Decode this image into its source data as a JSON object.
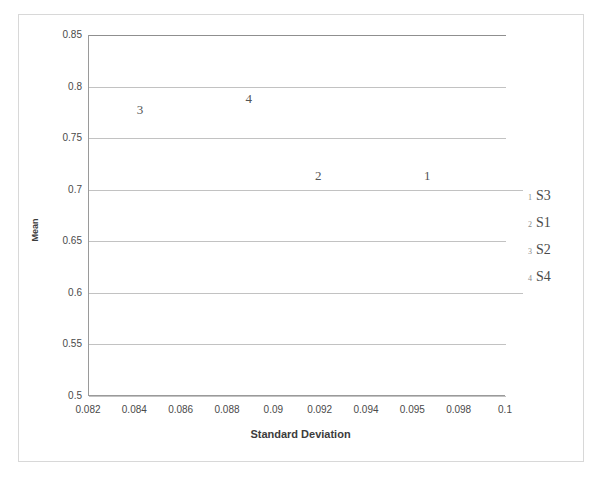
{
  "chart_data": {
    "type": "scatter",
    "title": "",
    "xlabel": "Standard Deviation",
    "ylabel": "Mean",
    "xlim": [
      0.082,
      0.1
    ],
    "ylim": [
      0.5,
      0.85
    ],
    "grid": true,
    "legend_position": "right",
    "xticks": [
      "0.082",
      "0.084",
      "0.086",
      "0.088",
      "0.09",
      "0.092",
      "0.094",
      "0.095",
      "0.098",
      "0.1"
    ],
    "xtick_values": [
      0.082,
      0.084,
      0.086,
      0.088,
      0.09,
      0.092,
      0.094,
      0.096,
      0.098,
      0.1
    ],
    "yticks": [
      "0.5",
      "0.55",
      "0.6",
      "0.65",
      "0.7",
      "0.75",
      "0.8",
      "0.85"
    ],
    "ytick_values": [
      0.5,
      0.55,
      0.6,
      0.65,
      0.7,
      0.75,
      0.8,
      0.85
    ],
    "points": [
      {
        "marker": "1",
        "series": "S3",
        "x": 0.0966,
        "y": 0.713
      },
      {
        "marker": "2",
        "series": "S1",
        "x": 0.0919,
        "y": 0.713
      },
      {
        "marker": "3",
        "series": "S2",
        "x": 0.0842,
        "y": 0.777
      },
      {
        "marker": "4",
        "series": "S4",
        "x": 0.0889,
        "y": 0.788
      }
    ],
    "legend": [
      {
        "marker": "1",
        "label": "S3"
      },
      {
        "marker": "2",
        "label": "S1"
      },
      {
        "marker": "3",
        "label": "S2"
      },
      {
        "marker": "4",
        "label": "S4"
      }
    ]
  }
}
